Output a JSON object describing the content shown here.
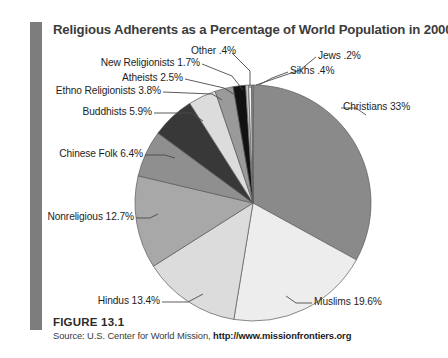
{
  "figure": {
    "title": "Religious Adherents as a Percentage of World Population in 2000",
    "number": "FIGURE 13.1",
    "source_prefix": "Source: U.S. Center for World Mission,",
    "source_url": "http://www.missionfrontiers.org"
  },
  "colors": {
    "accent_bar": "#7d7d7d",
    "title_text": "#3c3c3c",
    "label_text": "#1e1e1e",
    "leader_line": "#4a4a4a",
    "slice_outline": "#5a5a5a"
  },
  "chart_data": {
    "type": "pie",
    "title": "Religious Adherents as a Percentage of World Population in 2000",
    "xlabel": "",
    "ylabel": "",
    "units": "percent of world population",
    "legend": "none (direct labels with leader lines)",
    "start_angle_deg": -90,
    "direction": "clockwise",
    "categories": [
      "Christians",
      "Muslims",
      "Hindus",
      "Nonreligious",
      "Chinese Folk",
      "Buddhists",
      "Ethno Religionists",
      "Atheists",
      "New Religionists",
      "Other",
      "Sikhs",
      "Jews"
    ],
    "values": [
      33,
      19.6,
      13.4,
      12.7,
      6.4,
      5.9,
      3.8,
      2.5,
      1.7,
      0.4,
      0.4,
      0.2
    ],
    "slices": [
      {
        "label": "Christians 33%",
        "name": "Christians",
        "value": 33,
        "color": "#8a8a8a"
      },
      {
        "label": "Muslims 19.6%",
        "name": "Muslims",
        "value": 19.6,
        "color": "#ededed"
      },
      {
        "label": "Hindus 13.4%",
        "name": "Hindus",
        "value": 13.4,
        "color": "#dcdcdc"
      },
      {
        "label": "Nonreligious 12.7%",
        "name": "Nonreligious",
        "value": 12.7,
        "color": "#a8a8a8"
      },
      {
        "label": "Chinese Folk 6.4%",
        "name": "Chinese Folk",
        "value": 6.4,
        "color": "#8f8f8f"
      },
      {
        "label": "Buddhists 5.9%",
        "name": "Buddhists",
        "value": 5.9,
        "color": "#383838"
      },
      {
        "label": "Ethno Religionists 3.8%",
        "name": "Ethno Religionists",
        "value": 3.8,
        "color": "#dcdcdc"
      },
      {
        "label": "Atheists 2.5%",
        "name": "Atheists",
        "value": 2.5,
        "color": "#9a9a9a"
      },
      {
        "label": "New Religionists 1.7%",
        "name": "New Religionists",
        "value": 1.7,
        "color": "#121212"
      },
      {
        "label": "Other .4%",
        "name": "Other",
        "value": 0.4,
        "color": "#c8c8c8"
      },
      {
        "label": "Sikhs .4%",
        "name": "Sikhs",
        "value": 0.4,
        "color": "#f2f2f2"
      },
      {
        "label": "Jews .2%",
        "name": "Jews",
        "value": 0.2,
        "color": "#9a9a9a"
      }
    ]
  },
  "labels": {
    "other": "Other .4%",
    "jews": "Jews .2%",
    "sikhs": "Sikhs .4%",
    "new_religionists": "New Religionists 1.7%",
    "atheists": "Atheists 2.5%",
    "ethno_religionists": "Ethno Religionists 3.8%",
    "buddhists": "Buddhists 5.9%",
    "chinese_folk": "Chinese Folk 6.4%",
    "nonreligious": "Nonreligious 12.7%",
    "hindus": "Hindus 13.4%",
    "muslims": "Muslims 19.6%",
    "christians": "Christians 33%"
  }
}
